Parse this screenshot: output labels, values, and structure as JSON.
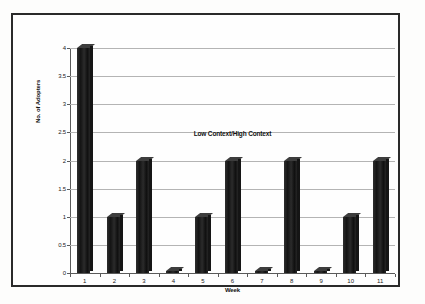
{
  "chart_data": {
    "type": "bar",
    "title": "",
    "annotation": "Low Context/High Context",
    "xlabel": "Week",
    "ylabel": "No. of Adopters",
    "categories": [
      "1",
      "2",
      "3",
      "4",
      "5",
      "6",
      "7",
      "8",
      "9",
      "10",
      "11"
    ],
    "values": [
      4,
      1,
      2,
      0,
      1,
      2,
      0,
      2,
      0,
      1,
      2
    ],
    "ylim": [
      0,
      4
    ],
    "ytick_labels": [
      "0",
      "0.5",
      "1",
      "1.5",
      "2",
      "2.5",
      "3",
      "3.5",
      "4"
    ],
    "ytick_values": [
      0,
      0.5,
      1,
      1.5,
      2,
      2.5,
      3,
      3.5,
      4
    ],
    "grid": true,
    "legend": "none",
    "series": [
      {
        "name": "No. of Adopters",
        "values": [
          4,
          1,
          2,
          0,
          1,
          2,
          0,
          2,
          0,
          1,
          2
        ],
        "color": "#232323"
      }
    ],
    "style": {
      "bar_color": "#232323",
      "gridline_color": "#b4b4b4",
      "axis_color": "#5a5a5a",
      "frame_color": "#2a2a2a",
      "background": "#fefefe"
    }
  }
}
